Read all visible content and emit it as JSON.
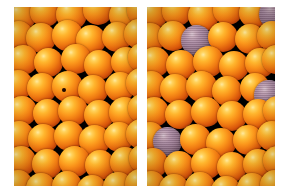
{
  "figure": {
    "kind": "micrograph-pair",
    "background_color": "#ffffff",
    "panel_background_color": "#000000",
    "sphere_color": "#f7901e",
    "sphere_highlight_color": "#ffe9a0",
    "sphere_shadow_color": "#5d1a03",
    "tagged_sphere_color": "#9b7a92",
    "defect_color": "#1a0601"
  },
  "panels": [
    {
      "name": "left-panel",
      "label": "",
      "x": 14,
      "y": 7,
      "width": 123,
      "height": 179,
      "tagged_count": 0,
      "defect_count": 1,
      "defects": [
        {
          "x": 48,
          "y": 81,
          "d": 4
        }
      ],
      "spheres": [
        {
          "x": -8,
          "y": -6,
          "d": 30,
          "tagged": false
        },
        {
          "x": 16,
          "y": -10,
          "d": 30,
          "tagged": false
        },
        {
          "x": 42,
          "y": -8,
          "d": 31,
          "tagged": false
        },
        {
          "x": 69,
          "y": -12,
          "d": 30,
          "tagged": false
        },
        {
          "x": 95,
          "y": -7,
          "d": 31,
          "tagged": false
        },
        {
          "x": 113,
          "y": -11,
          "d": 29,
          "tagged": false
        },
        {
          "x": -10,
          "y": 14,
          "d": 29,
          "tagged": false
        },
        {
          "x": 12,
          "y": 16,
          "d": 30,
          "tagged": false
        },
        {
          "x": 38,
          "y": 13,
          "d": 31,
          "tagged": false
        },
        {
          "x": 62,
          "y": 18,
          "d": 30,
          "tagged": false
        },
        {
          "x": 88,
          "y": 15,
          "d": 30,
          "tagged": false
        },
        {
          "x": 110,
          "y": 12,
          "d": 30,
          "tagged": false
        },
        {
          "x": -6,
          "y": 38,
          "d": 30,
          "tagged": false
        },
        {
          "x": 20,
          "y": 41,
          "d": 29,
          "tagged": false
        },
        {
          "x": 47,
          "y": 37,
          "d": 30,
          "tagged": false
        },
        {
          "x": 70,
          "y": 43,
          "d": 30,
          "tagged": false
        },
        {
          "x": 97,
          "y": 40,
          "d": 30,
          "tagged": false
        },
        {
          "x": 114,
          "y": 36,
          "d": 29,
          "tagged": false
        },
        {
          "x": -11,
          "y": 63,
          "d": 30,
          "tagged": false
        },
        {
          "x": 13,
          "y": 66,
          "d": 30,
          "tagged": false
        },
        {
          "x": 38,
          "y": 64,
          "d": 31,
          "tagged": false
        },
        {
          "x": 64,
          "y": 68,
          "d": 30,
          "tagged": false
        },
        {
          "x": 91,
          "y": 65,
          "d": 30,
          "tagged": false
        },
        {
          "x": 112,
          "y": 61,
          "d": 30,
          "tagged": false
        },
        {
          "x": -7,
          "y": 89,
          "d": 30,
          "tagged": false
        },
        {
          "x": 19,
          "y": 92,
          "d": 29,
          "tagged": false
        },
        {
          "x": 44,
          "y": 89,
          "d": 30,
          "tagged": false
        },
        {
          "x": 70,
          "y": 93,
          "d": 30,
          "tagged": false
        },
        {
          "x": 95,
          "y": 90,
          "d": 31,
          "tagged": false
        },
        {
          "x": 114,
          "y": 87,
          "d": 29,
          "tagged": false
        },
        {
          "x": -10,
          "y": 114,
          "d": 30,
          "tagged": false
        },
        {
          "x": 14,
          "y": 117,
          "d": 30,
          "tagged": false
        },
        {
          "x": 40,
          "y": 114,
          "d": 30,
          "tagged": false
        },
        {
          "x": 65,
          "y": 118,
          "d": 31,
          "tagged": false
        },
        {
          "x": 90,
          "y": 115,
          "d": 30,
          "tagged": false
        },
        {
          "x": 112,
          "y": 112,
          "d": 30,
          "tagged": false
        },
        {
          "x": -8,
          "y": 139,
          "d": 30,
          "tagged": false
        },
        {
          "x": 18,
          "y": 142,
          "d": 30,
          "tagged": false
        },
        {
          "x": 45,
          "y": 139,
          "d": 31,
          "tagged": false
        },
        {
          "x": 71,
          "y": 143,
          "d": 30,
          "tagged": false
        },
        {
          "x": 96,
          "y": 140,
          "d": 30,
          "tagged": false
        },
        {
          "x": 115,
          "y": 137,
          "d": 29,
          "tagged": false
        },
        {
          "x": -11,
          "y": 163,
          "d": 30,
          "tagged": false
        },
        {
          "x": 12,
          "y": 166,
          "d": 30,
          "tagged": false
        },
        {
          "x": 38,
          "y": 164,
          "d": 30,
          "tagged": false
        },
        {
          "x": 63,
          "y": 168,
          "d": 30,
          "tagged": false
        },
        {
          "x": 89,
          "y": 165,
          "d": 30,
          "tagged": false
        },
        {
          "x": 111,
          "y": 162,
          "d": 30,
          "tagged": false
        }
      ]
    },
    {
      "name": "right-panel",
      "label": "",
      "x": 147,
      "y": 7,
      "width": 128,
      "height": 179,
      "tagged_count": 4,
      "defect_count": 0,
      "defects": [],
      "spheres": [
        {
          "x": -9,
          "y": -8,
          "d": 30,
          "tagged": false
        },
        {
          "x": 15,
          "y": -11,
          "d": 30,
          "tagged": false
        },
        {
          "x": 41,
          "y": -7,
          "d": 31,
          "tagged": false
        },
        {
          "x": 66,
          "y": -12,
          "d": 30,
          "tagged": false
        },
        {
          "x": 92,
          "y": -9,
          "d": 30,
          "tagged": false
        },
        {
          "x": 112,
          "y": -8,
          "d": 30,
          "tagged": true
        },
        {
          "x": -12,
          "y": 16,
          "d": 30,
          "tagged": false
        },
        {
          "x": 11,
          "y": 14,
          "d": 30,
          "tagged": false
        },
        {
          "x": 34,
          "y": 18,
          "d": 31,
          "tagged": true
        },
        {
          "x": 61,
          "y": 15,
          "d": 30,
          "tagged": false
        },
        {
          "x": 88,
          "y": 17,
          "d": 30,
          "tagged": false
        },
        {
          "x": 110,
          "y": 14,
          "d": 30,
          "tagged": false
        },
        {
          "x": -7,
          "y": 40,
          "d": 30,
          "tagged": false
        },
        {
          "x": 19,
          "y": 43,
          "d": 30,
          "tagged": false
        },
        {
          "x": 46,
          "y": 39,
          "d": 31,
          "tagged": false
        },
        {
          "x": 72,
          "y": 44,
          "d": 30,
          "tagged": false
        },
        {
          "x": 98,
          "y": 41,
          "d": 30,
          "tagged": false
        },
        {
          "x": 115,
          "y": 38,
          "d": 29,
          "tagged": false
        },
        {
          "x": -11,
          "y": 64,
          "d": 30,
          "tagged": false
        },
        {
          "x": 13,
          "y": 67,
          "d": 30,
          "tagged": false
        },
        {
          "x": 39,
          "y": 64,
          "d": 31,
          "tagged": false
        },
        {
          "x": 65,
          "y": 69,
          "d": 30,
          "tagged": false
        },
        {
          "x": 93,
          "y": 66,
          "d": 30,
          "tagged": false
        },
        {
          "x": 107,
          "y": 73,
          "d": 30,
          "tagged": true
        },
        {
          "x": -8,
          "y": 90,
          "d": 30,
          "tagged": false
        },
        {
          "x": 18,
          "y": 93,
          "d": 29,
          "tagged": false
        },
        {
          "x": 44,
          "y": 90,
          "d": 30,
          "tagged": false
        },
        {
          "x": 70,
          "y": 94,
          "d": 30,
          "tagged": false
        },
        {
          "x": 96,
          "y": 92,
          "d": 30,
          "tagged": false
        },
        {
          "x": 116,
          "y": 89,
          "d": 29,
          "tagged": false
        },
        {
          "x": -12,
          "y": 115,
          "d": 30,
          "tagged": false
        },
        {
          "x": 6,
          "y": 120,
          "d": 29,
          "tagged": true
        },
        {
          "x": 33,
          "y": 117,
          "d": 31,
          "tagged": false
        },
        {
          "x": 59,
          "y": 121,
          "d": 30,
          "tagged": false
        },
        {
          "x": 86,
          "y": 118,
          "d": 30,
          "tagged": false
        },
        {
          "x": 110,
          "y": 114,
          "d": 30,
          "tagged": false
        },
        {
          "x": -9,
          "y": 141,
          "d": 30,
          "tagged": false
        },
        {
          "x": 17,
          "y": 144,
          "d": 30,
          "tagged": false
        },
        {
          "x": 44,
          "y": 141,
          "d": 31,
          "tagged": false
        },
        {
          "x": 70,
          "y": 145,
          "d": 30,
          "tagged": false
        },
        {
          "x": 96,
          "y": 142,
          "d": 30,
          "tagged": false
        },
        {
          "x": 116,
          "y": 139,
          "d": 29,
          "tagged": false
        },
        {
          "x": -11,
          "y": 164,
          "d": 30,
          "tagged": false
        },
        {
          "x": 12,
          "y": 167,
          "d": 30,
          "tagged": false
        },
        {
          "x": 38,
          "y": 165,
          "d": 30,
          "tagged": false
        },
        {
          "x": 64,
          "y": 169,
          "d": 30,
          "tagged": false
        },
        {
          "x": 90,
          "y": 166,
          "d": 30,
          "tagged": false
        },
        {
          "x": 113,
          "y": 163,
          "d": 30,
          "tagged": false
        }
      ]
    }
  ]
}
